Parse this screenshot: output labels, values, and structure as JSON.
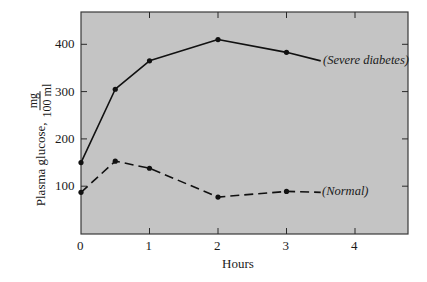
{
  "chart_data": {
    "type": "line",
    "title": "",
    "xlabel": "Hours",
    "ylabel": "Plasma glucose,",
    "ylabel_unit_numerator": "mg",
    "ylabel_unit_denominator": "100 ml",
    "xlim": [
      0,
      4.8
    ],
    "ylim": [
      0,
      470
    ],
    "x_ticks": [
      "0",
      "1",
      "2",
      "3",
      "4"
    ],
    "y_ticks": [
      "100",
      "200",
      "300",
      "400"
    ],
    "grid": false,
    "legend_position": "inline labels at line ends",
    "plot_background": "#c4c4c4",
    "series": [
      {
        "name": "(Severe diabetes)",
        "style": "solid",
        "x": [
          0,
          0.5,
          1,
          2,
          3
        ],
        "values": [
          150,
          305,
          365,
          410,
          383
        ],
        "line_end": [
          3.5,
          365
        ]
      },
      {
        "name": "(Normal)",
        "style": "dashed",
        "x": [
          0,
          0.5,
          1,
          2,
          3
        ],
        "values": [
          87,
          153,
          138,
          77,
          89
        ],
        "line_end": [
          3.5,
          87
        ]
      }
    ]
  }
}
